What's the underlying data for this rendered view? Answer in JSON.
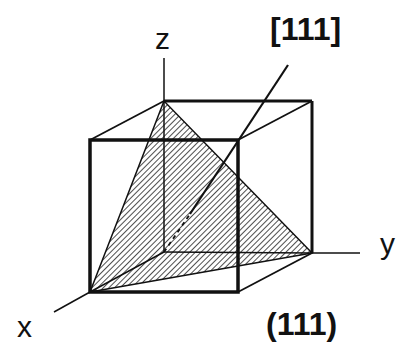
{
  "diagram": {
    "axes": {
      "x": "x",
      "y": "y",
      "z": "z"
    },
    "direction_label": "[111]",
    "plane_label": "(111)",
    "colors": {
      "line": "#111111",
      "hatch": "#222222",
      "background": "#ffffff"
    }
  }
}
